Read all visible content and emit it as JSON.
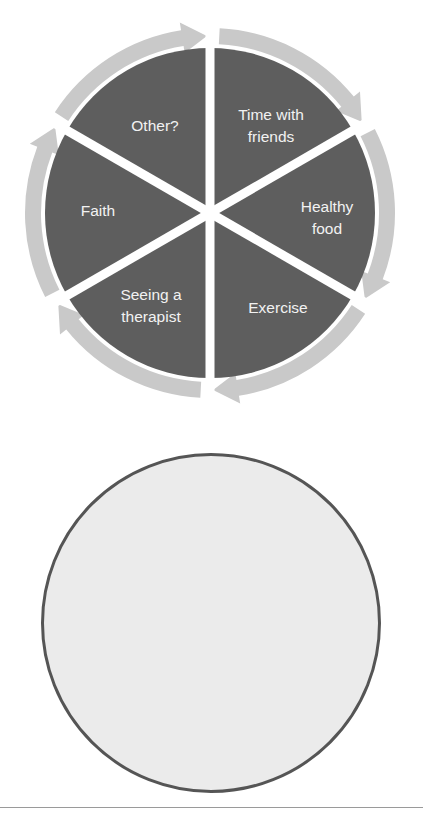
{
  "wheel": {
    "center": [
      210,
      213
    ],
    "pie_radius": 165,
    "ring_inner": 169,
    "ring_outer": 185,
    "head_inner": 162,
    "head_outer": 193,
    "divider_width": 9,
    "colors": {
      "pie": "#5e5e5e",
      "ring": "#c9c9c9",
      "divider": "#ffffff",
      "label": "#f2f2f2"
    },
    "divider_angles_deg": [
      90,
      30,
      -30,
      -90,
      -150,
      150
    ],
    "sectors": [
      {
        "label_lines": [
          "Time with",
          "friends"
        ],
        "start_deg": 90,
        "end_deg": 30,
        "label_pos": [
          271,
          120
        ]
      },
      {
        "label_lines": [
          "Healthy",
          "food"
        ],
        "start_deg": 30,
        "end_deg": -30,
        "label_pos": [
          327,
          212
        ]
      },
      {
        "label_lines": [
          "Exercise"
        ],
        "start_deg": -30,
        "end_deg": -90,
        "label_pos": [
          278,
          313
        ]
      },
      {
        "label_lines": [
          "Seeing a",
          "therapist"
        ],
        "start_deg": -90,
        "end_deg": -150,
        "label_pos": [
          151,
          300
        ]
      },
      {
        "label_lines": [
          "Faith"
        ],
        "start_deg": -150,
        "end_deg": 150,
        "label_pos": [
          98,
          216
        ]
      },
      {
        "label_lines": [
          "Other?"
        ],
        "start_deg": 150,
        "end_deg": 90,
        "label_pos": [
          155,
          131
        ]
      }
    ]
  },
  "blank_circle": {
    "center": [
      211,
      623
    ],
    "radius": 170,
    "fill": "#ebebeb",
    "stroke": "#555555"
  },
  "bottom_rule": {
    "y": 807
  }
}
